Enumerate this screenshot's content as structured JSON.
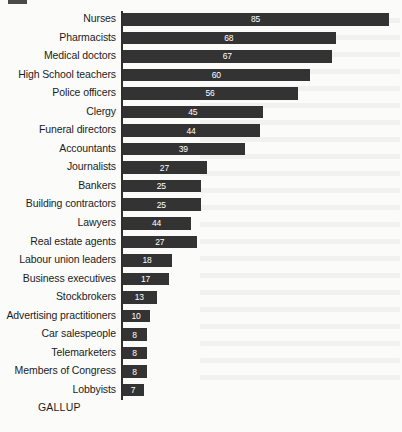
{
  "source_label": "GALLUP",
  "colors": {
    "bar": "#333333",
    "bar_value_text": "#ffffff",
    "category_text": "#1c1c1c",
    "axis": "#2e2e2e",
    "background": "#fbfbfa"
  },
  "chart_data": {
    "type": "bar",
    "orientation": "horizontal",
    "title": "",
    "subtitle": "",
    "xlabel": "",
    "ylabel": "",
    "grid": false,
    "legend": false,
    "axis_visible": "y-axis only (vertical baseline at zero)",
    "xlim": [
      0,
      85
    ],
    "value_labels_inside_bars": true,
    "categories": [
      "Nurses",
      "Pharmacists",
      "Medical doctors",
      "High School teachers",
      "Police officers",
      "Clergy",
      "Funeral directors",
      "Accountants",
      "Journalists",
      "Bankers",
      "Building contractors",
      "Lawyers",
      "Real estate agents",
      "Labour union leaders",
      "Business executives",
      "Stockbrokers",
      "Advertising practitioners",
      "Car salespeople",
      "Telemarketers",
      "Members of Congress",
      "Lobbyists"
    ],
    "values": [
      85,
      68,
      67,
      60,
      56,
      45,
      44,
      39,
      27,
      25,
      25,
      44,
      27,
      18,
      17,
      13,
      10,
      8,
      8,
      8,
      7
    ],
    "bar_lengths_as_drawn": [
      85,
      68,
      67,
      60,
      56,
      45,
      44,
      39,
      27,
      25,
      25,
      22,
      24,
      16,
      15,
      11,
      9,
      8,
      8,
      8,
      7
    ],
    "rows": [
      {
        "label": "Nurses",
        "value": 85,
        "drawn": 85
      },
      {
        "label": "Pharmacists",
        "value": 68,
        "drawn": 68
      },
      {
        "label": "Medical doctors",
        "value": 67,
        "drawn": 67
      },
      {
        "label": "High School teachers",
        "value": 60,
        "drawn": 60
      },
      {
        "label": "Police officers",
        "value": 56,
        "drawn": 56
      },
      {
        "label": "Clergy",
        "value": 45,
        "drawn": 45
      },
      {
        "label": "Funeral directors",
        "value": 44,
        "drawn": 44
      },
      {
        "label": "Accountants",
        "value": 39,
        "drawn": 39
      },
      {
        "label": "Journalists",
        "value": 27,
        "drawn": 27
      },
      {
        "label": "Bankers",
        "value": 25,
        "drawn": 25
      },
      {
        "label": "Building contractors",
        "value": 25,
        "drawn": 25
      },
      {
        "label": "Lawyers",
        "value": 44,
        "drawn": 22
      },
      {
        "label": "Real estate agents",
        "value": 27,
        "drawn": 24
      },
      {
        "label": "Labour union leaders",
        "value": 18,
        "drawn": 16
      },
      {
        "label": "Business executives",
        "value": 17,
        "drawn": 15
      },
      {
        "label": "Stockbrokers",
        "value": 13,
        "drawn": 11
      },
      {
        "label": "Advertising practitioners",
        "value": 10,
        "drawn": 9
      },
      {
        "label": "Car salespeople",
        "value": 8,
        "drawn": 8
      },
      {
        "label": "Telemarketers",
        "value": 8,
        "drawn": 8
      },
      {
        "label": "Members of Congress",
        "value": 8,
        "drawn": 8
      },
      {
        "label": "Lobbyists",
        "value": 7,
        "drawn": 7
      }
    ]
  }
}
